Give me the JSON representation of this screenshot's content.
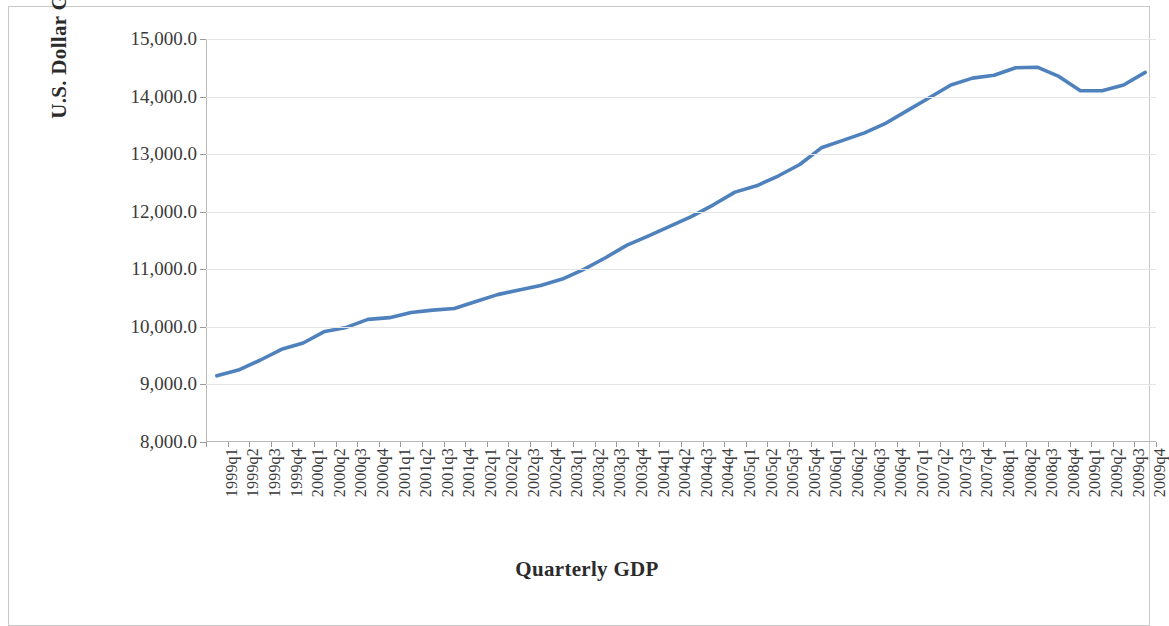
{
  "chart_data": {
    "type": "line",
    "title": "",
    "xlabel": "Quarterly GDP",
    "ylabel": "U.S. Dollar GDP",
    "ylim": [
      8000,
      15000
    ],
    "y_ticks": [
      8000,
      9000,
      10000,
      11000,
      12000,
      13000,
      14000,
      15000
    ],
    "y_tick_labels": [
      "8,000.0",
      "9,000.0",
      "10,000.0",
      "11,000.0",
      "12,000.0",
      "13,000.0",
      "14,000.0",
      "15,000.0"
    ],
    "grid": true,
    "legend": "none",
    "series_color": "#4f81bd",
    "categories": [
      "1999q1",
      "1999q2",
      "1999q3",
      "1999q4",
      "2000q1",
      "2000q2",
      "2000q3",
      "2000q4",
      "2001q1",
      "2001q2",
      "2001q3",
      "2001q4",
      "2002q1",
      "2002q2",
      "2002q3",
      "2002q4",
      "2003q1",
      "2003q2",
      "2003q3",
      "2003q4",
      "2004q1",
      "2004q2",
      "2004q3",
      "2004q4",
      "2005q1",
      "2005q2",
      "2005q3",
      "2005q4",
      "2006q1",
      "2006q2",
      "2006q3",
      "2006q4",
      "2007q1",
      "2007q2",
      "2007q3",
      "2007q4",
      "2008q1",
      "2008q2",
      "2008q3",
      "2008q4",
      "2009q1",
      "2009q2",
      "2009q3",
      "2009q4"
    ],
    "series": [
      {
        "name": "U.S. Dollar GDP",
        "values": [
          9150,
          9250,
          9420,
          9610,
          9720,
          9920,
          9990,
          10130,
          10160,
          10250,
          10290,
          10320,
          10440,
          10560,
          10640,
          10720,
          10830,
          11000,
          11200,
          11420,
          11580,
          11750,
          11920,
          12120,
          12340,
          12450,
          12620,
          12820,
          13110,
          13240,
          13370,
          13540,
          13760,
          13980,
          14200,
          14320,
          14370,
          14500,
          14510,
          14350,
          14100,
          14100,
          14200,
          14420
        ]
      }
    ]
  }
}
